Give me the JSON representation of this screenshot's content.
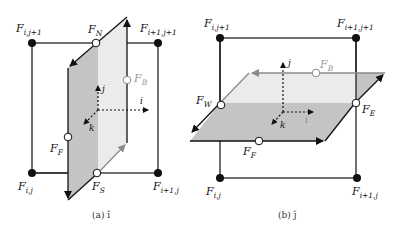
{
  "figure_a": {
    "caption": "(a) î",
    "corners": {
      "top_left": {
        "main": "F",
        "sub": "i,j+1"
      },
      "top_right": {
        "main": "F",
        "sub": "i+1,j+1"
      },
      "bottom_left": {
        "main": "F",
        "sub": "i,j"
      },
      "bottom_right": {
        "main": "F",
        "sub": "i+1,j"
      }
    },
    "faces": {
      "north": {
        "main": "F",
        "sub": "N"
      },
      "south": {
        "main": "F",
        "sub": "S"
      },
      "front": {
        "main": "F",
        "sub": "F"
      },
      "back": {
        "main": "F",
        "sub": "B"
      }
    },
    "axes": {
      "i": "i",
      "j": "j",
      "k": "k"
    }
  },
  "figure_b": {
    "caption": "(b) ĵ",
    "corners": {
      "top_left": {
        "main": "F",
        "sub": "i,j+1"
      },
      "top_right": {
        "main": "F",
        "sub": "i+1,j+1"
      },
      "bottom_left": {
        "main": "F",
        "sub": "i,j"
      },
      "bottom_right": {
        "main": "F",
        "sub": "i+1,j"
      }
    },
    "faces": {
      "west": {
        "main": "F",
        "sub": "W"
      },
      "east": {
        "main": "F",
        "sub": "E"
      },
      "front": {
        "main": "F",
        "sub": "F"
      },
      "back": {
        "main": "F",
        "sub": "B"
      }
    },
    "axes": {
      "i": "i",
      "j": "j",
      "k": "k"
    }
  },
  "colors": {
    "dark_face": "#c4c4c4",
    "light_face": "#ebebeb",
    "line": "#111111",
    "gray_line": "#8a8a8a"
  }
}
